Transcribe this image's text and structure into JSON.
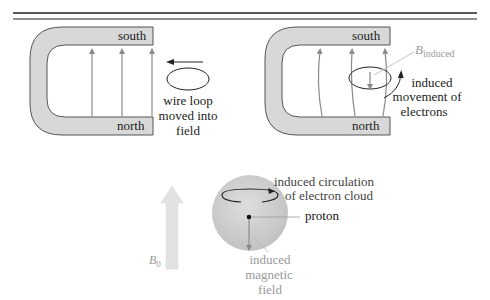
{
  "top_rule": {
    "color": "#222222"
  },
  "panel_left": {
    "magnet": {
      "top_pole": "south",
      "bottom_pole": "north"
    },
    "loop_caption": [
      "wire loop",
      "moved into",
      "field"
    ]
  },
  "panel_right": {
    "magnet": {
      "top_pole": "south",
      "bottom_pole": "north"
    },
    "b_induced": {
      "symbol": "B",
      "subscript": "induced"
    },
    "movement_caption": [
      "induced",
      "movement of",
      "electrons"
    ]
  },
  "atom_panel": {
    "b0": {
      "symbol": "B",
      "subscript": "0"
    },
    "circulation_caption": [
      "induced circulation",
      "of electron cloud"
    ],
    "proton_label": "proton",
    "field_caption": [
      "induced",
      "magnetic",
      "field"
    ]
  },
  "colors": {
    "magnet_fill": "#d8d8d8",
    "magnet_stroke": "#555555",
    "field_line": "#8a8a8a",
    "label_gray": "#9a9a9a",
    "sphere": "#cfcfcf",
    "b0_arrow": "#e2e2e2"
  }
}
